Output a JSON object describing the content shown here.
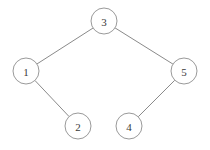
{
  "diagram": {
    "background_color": "#ffffff",
    "node_fill_color": "#ffffff",
    "node_stroke_color": "#9a9a9a",
    "edge_color": "#8a8a8a",
    "label_color": "#3a3a3a",
    "node_radius": 13,
    "nodes": [
      {
        "id": "n3",
        "label": "3",
        "cx": 104,
        "cy": 21,
        "role": "root"
      },
      {
        "id": "n1",
        "label": "1",
        "cx": 26,
        "cy": 71,
        "role": "left-child-of-3"
      },
      {
        "id": "n5",
        "label": "5",
        "cx": 184,
        "cy": 71,
        "role": "right-child-of-3"
      },
      {
        "id": "n2",
        "label": "2",
        "cx": 78,
        "cy": 126,
        "role": "right-child-of-1"
      },
      {
        "id": "n4",
        "label": "4",
        "cx": 129,
        "cy": 126,
        "role": "left-child-of-5"
      }
    ],
    "edges": [
      {
        "id": "e-3-1",
        "from": "n3",
        "to": "n1",
        "x1": 93,
        "y1": 28,
        "x2": 37,
        "y2": 64
      },
      {
        "id": "e-3-5",
        "from": "n3",
        "to": "n5",
        "x1": 115,
        "y1": 28,
        "x2": 173,
        "y2": 64
      },
      {
        "id": "e-1-2",
        "from": "n1",
        "to": "n2",
        "x1": 35,
        "y1": 80,
        "x2": 69,
        "y2": 118
      },
      {
        "id": "e-5-4",
        "from": "n5",
        "to": "n4",
        "x1": 175,
        "y1": 80,
        "x2": 138,
        "y2": 118
      }
    ]
  }
}
